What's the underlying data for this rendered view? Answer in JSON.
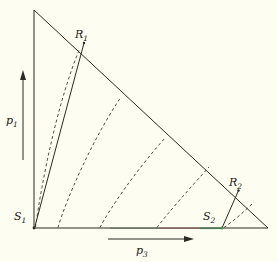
{
  "figure": {
    "kind": "geometric-diagram",
    "title": "",
    "background_color": "#fdfdf2",
    "line_color": "#2b2b24",
    "dashed_color": "#3a3a30"
  },
  "axes": {
    "vertical": {
      "symbol": "p",
      "subscript": "1",
      "label": "p1",
      "direction": "up"
    },
    "horizontal": {
      "symbol": "p",
      "subscript": "3",
      "label": "p3",
      "direction": "right"
    }
  },
  "points": [
    {
      "id": "S1",
      "symbol": "S",
      "subscript": "1",
      "label": "S1",
      "x": 34,
      "y": 228
    },
    {
      "id": "S2",
      "symbol": "S",
      "subscript": "2",
      "label": "S2",
      "x": 222,
      "y": 228
    },
    {
      "id": "R1",
      "symbol": "R",
      "subscript": "1",
      "label": "R1",
      "x": 85,
      "y": 42
    },
    {
      "id": "R2",
      "symbol": "R",
      "subscript": "2",
      "label": "R2",
      "x": 238,
      "y": 190
    }
  ],
  "triangle": {
    "apex": {
      "x": 34,
      "y": 10
    },
    "origin": {
      "x": 34,
      "y": 228
    },
    "right": {
      "x": 268,
      "y": 228
    }
  },
  "rays": [
    {
      "name": "S1-to-R1",
      "from": "S1",
      "to": "R1"
    },
    {
      "name": "S2-to-R2",
      "from": "S2",
      "to": "R2"
    }
  ],
  "segment_colors": {
    "green_left": "#7fb88a",
    "red_middle": "#e0867f",
    "green_right": "#7fb88a"
  },
  "dashed_curves": {
    "count": 5,
    "description": "characteristic curves rising from the horizontal axis to the hypotenuse"
  }
}
